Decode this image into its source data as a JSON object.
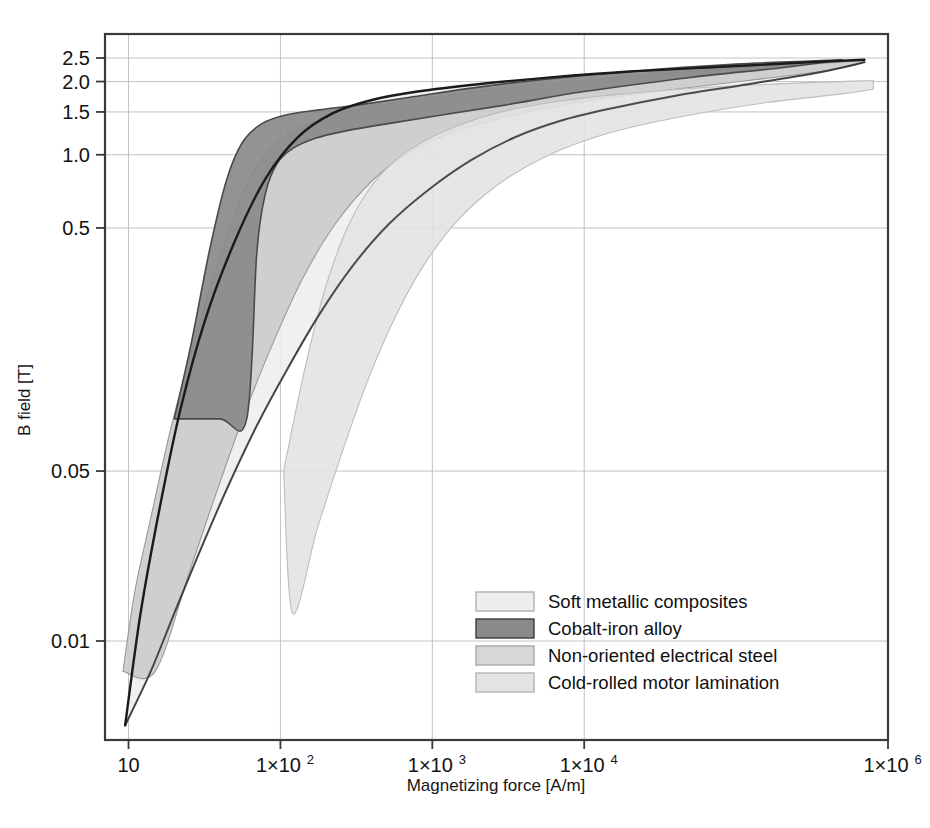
{
  "chart_data": {
    "type": "area",
    "title": "",
    "subtitle": "",
    "xlabel": "Magnetizing force [A/m]",
    "ylabel": "B field [T]",
    "xscale": "log",
    "yscale": "log",
    "xlim": [
      7,
      1000000
    ],
    "ylim": [
      0.004,
      3.1
    ],
    "grid": true,
    "legend_position": "lower-right",
    "xticks": [
      {
        "value": 10,
        "label": "10",
        "mantissa": "",
        "exponent": ""
      },
      {
        "value": 100,
        "label": "1×10",
        "mantissa": "1×10",
        "exponent": "2"
      },
      {
        "value": 1000,
        "label": "1×10",
        "mantissa": "1×10",
        "exponent": "3"
      },
      {
        "value": 10000,
        "label": "1×10",
        "mantissa": "1×10",
        "exponent": "4"
      },
      {
        "value": 1000000,
        "label": "1×10",
        "mantissa": "1×10",
        "exponent": "6"
      }
    ],
    "yticks": [
      {
        "value": 2.5,
        "label": "2.5"
      },
      {
        "value": 2.0,
        "label": "2.0"
      },
      {
        "value": 1.5,
        "label": "1.5"
      },
      {
        "value": 1.0,
        "label": "1.0"
      },
      {
        "value": 0.5,
        "label": "0.5"
      },
      {
        "value": 0.05,
        "label": "0.05"
      },
      {
        "value": 0.01,
        "label": "0.01"
      }
    ],
    "series": [
      {
        "name": "Soft metallic composites",
        "color": "#eeeeee",
        "edge_color": "#b0b0b0",
        "upper": [
          [
            9.5,
            0.0045
          ],
          [
            12,
            0.013
          ],
          [
            16,
            0.035
          ],
          [
            22,
            0.09
          ],
          [
            32,
            0.21
          ],
          [
            50,
            0.44
          ],
          [
            80,
            0.8
          ],
          [
            130,
            1.18
          ],
          [
            220,
            1.48
          ],
          [
            400,
            1.68
          ],
          [
            800,
            1.82
          ],
          [
            2000,
            1.95
          ],
          [
            6000,
            2.08
          ],
          [
            20000,
            2.2
          ],
          [
            80000,
            2.3
          ],
          [
            300000,
            2.4
          ],
          [
            700000,
            2.46
          ]
        ],
        "lower": [
          [
            9.5,
            0.0045
          ],
          [
            14,
            0.0075
          ],
          [
            20,
            0.013
          ],
          [
            30,
            0.024
          ],
          [
            45,
            0.043
          ],
          [
            70,
            0.077
          ],
          [
            110,
            0.13
          ],
          [
            180,
            0.22
          ],
          [
            300,
            0.35
          ],
          [
            520,
            0.52
          ],
          [
            950,
            0.72
          ],
          [
            1800,
            0.95
          ],
          [
            3500,
            1.18
          ],
          [
            7000,
            1.38
          ],
          [
            15000,
            1.55
          ],
          [
            40000,
            1.75
          ],
          [
            120000,
            1.95
          ],
          [
            350000,
            2.18
          ],
          [
            700000,
            2.4
          ]
        ]
      },
      {
        "name": "Cobalt-iron alloy",
        "color": "#8a8a8a",
        "edge_color": "#4a4a4a",
        "upper": [
          [
            20,
            0.082
          ],
          [
            26,
            0.17
          ],
          [
            34,
            0.4
          ],
          [
            44,
            0.78
          ],
          [
            56,
            1.12
          ],
          [
            75,
            1.34
          ],
          [
            110,
            1.46
          ],
          [
            180,
            1.53
          ],
          [
            320,
            1.6
          ],
          [
            700,
            1.72
          ],
          [
            1800,
            1.88
          ],
          [
            5000,
            2.03
          ],
          [
            20000,
            2.2
          ],
          [
            100000,
            2.36
          ],
          [
            500000,
            2.46
          ]
        ],
        "lower": [
          [
            20,
            0.082
          ],
          [
            40,
            0.082
          ],
          [
            60,
            0.082
          ],
          [
            70,
            0.4
          ],
          [
            80,
            0.7
          ],
          [
            95,
            0.92
          ],
          [
            120,
            1.06
          ],
          [
            170,
            1.17
          ],
          [
            280,
            1.26
          ],
          [
            500,
            1.34
          ],
          [
            1100,
            1.45
          ],
          [
            3000,
            1.6
          ],
          [
            10000,
            1.82
          ],
          [
            50000,
            2.08
          ],
          [
            200000,
            2.28
          ],
          [
            500000,
            2.46
          ]
        ]
      },
      {
        "name": "Non-oriented electrical steel",
        "color": "#c9c9c9",
        "edge_color": "#9a9a9a",
        "upper": [
          [
            9.2,
            0.0075
          ],
          [
            11,
            0.016
          ],
          [
            14,
            0.032
          ],
          [
            19,
            0.075
          ],
          [
            27,
            0.17
          ],
          [
            40,
            0.38
          ],
          [
            58,
            0.72
          ],
          [
            85,
            1.05
          ],
          [
            130,
            1.28
          ],
          [
            220,
            1.45
          ],
          [
            420,
            1.58
          ],
          [
            1000,
            1.72
          ],
          [
            3000,
            1.88
          ],
          [
            10000,
            2.02
          ],
          [
            60000,
            2.22
          ],
          [
            300000,
            2.36
          ],
          [
            700000,
            2.44
          ]
        ],
        "lower": [
          [
            9.2,
            0.0075
          ],
          [
            15,
            0.0075
          ],
          [
            25,
            0.019
          ],
          [
            38,
            0.041
          ],
          [
            58,
            0.086
          ],
          [
            90,
            0.17
          ],
          [
            140,
            0.31
          ],
          [
            230,
            0.52
          ],
          [
            400,
            0.78
          ],
          [
            700,
            1.02
          ],
          [
            1400,
            1.24
          ],
          [
            3200,
            1.44
          ],
          [
            9000,
            1.64
          ],
          [
            30000,
            1.82
          ],
          [
            120000,
            2.02
          ],
          [
            400000,
            2.22
          ],
          [
            700000,
            2.4
          ]
        ]
      },
      {
        "name": "Cold-rolled motor lamination",
        "color": "#e2e2e2",
        "edge_color": "#bdbdbd",
        "upper": [
          [
            105,
            0.05
          ],
          [
            140,
            0.12
          ],
          [
            190,
            0.26
          ],
          [
            260,
            0.46
          ],
          [
            360,
            0.68
          ],
          [
            520,
            0.9
          ],
          [
            800,
            1.1
          ],
          [
            1400,
            1.3
          ],
          [
            2600,
            1.48
          ],
          [
            6000,
            1.64
          ],
          [
            18000,
            1.78
          ],
          [
            70000,
            1.9
          ],
          [
            300000,
            1.98
          ],
          [
            800000,
            2.02
          ]
        ],
        "lower": [
          [
            105,
            0.05
          ],
          [
            120,
            0.013
          ],
          [
            175,
            0.029
          ],
          [
            260,
            0.062
          ],
          [
            380,
            0.12
          ],
          [
            560,
            0.21
          ],
          [
            850,
            0.34
          ],
          [
            1400,
            0.52
          ],
          [
            2600,
            0.74
          ],
          [
            5500,
            0.98
          ],
          [
            14000,
            1.22
          ],
          [
            45000,
            1.44
          ],
          [
            160000,
            1.64
          ],
          [
            500000,
            1.78
          ],
          [
            800000,
            1.86
          ]
        ]
      }
    ],
    "legend": [
      {
        "label": "Soft metallic composites",
        "color": "#eeeeee",
        "edge_color": "#b0b0b0"
      },
      {
        "label": "Cobalt-iron alloy",
        "color": "#8a8a8a",
        "edge_color": "#3c3c3c"
      },
      {
        "label": "Non-oriented electrical steel",
        "color": "#d7d7d7",
        "edge_color": "#a8a8a8"
      },
      {
        "label": "Cold-rolled motor lamination",
        "color": "#e4e4e4",
        "edge_color": "#b4b4b4"
      }
    ],
    "colors": {
      "frame": "#3a3a3a",
      "grid": "#b9bcc4",
      "text": "#121212",
      "background": "#ffffff"
    }
  }
}
